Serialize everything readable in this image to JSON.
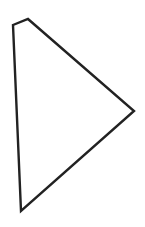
{
  "canvas": {
    "width": 145,
    "height": 227,
    "background": "#ffffff"
  },
  "shape": {
    "type": "polygon",
    "points": [
      [
        13,
        25
      ],
      [
        28,
        19
      ],
      [
        134,
        111
      ],
      [
        21,
        211
      ]
    ],
    "stroke": "#222222",
    "stroke_width": 2.4,
    "fill": "#ffffff"
  }
}
